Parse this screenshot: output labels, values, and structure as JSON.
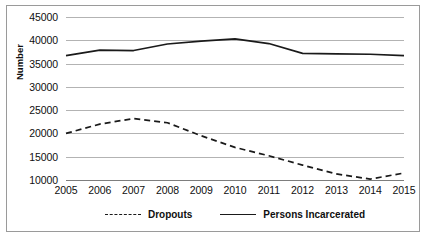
{
  "chart_data": {
    "type": "line",
    "title": "",
    "xlabel": "",
    "ylabel": "Number",
    "categories": [
      "2005",
      "2006",
      "2007",
      "2008",
      "2009",
      "2010",
      "2011",
      "2012",
      "2013",
      "2014",
      "2015"
    ],
    "x": [
      2005,
      2006,
      2007,
      2008,
      2009,
      2010,
      2011,
      2012,
      2013,
      2014,
      2015
    ],
    "ylim": [
      10000,
      45000
    ],
    "yticks": [
      10000,
      15000,
      20000,
      25000,
      30000,
      35000,
      40000,
      45000
    ],
    "ytick_labels": [
      "10000",
      "15000",
      "20000",
      "25000",
      "30000",
      "35000",
      "40000",
      "45000"
    ],
    "grid": "horizontal",
    "legend_position": "bottom",
    "series": [
      {
        "name": "Dropouts",
        "style": "dashed",
        "color": "#1a1a1a",
        "values": [
          20000,
          22000,
          23200,
          22300,
          19500,
          17000,
          15200,
          13200,
          11300,
          10200,
          11500
        ]
      },
      {
        "name": "Persons Incarcerated",
        "style": "solid",
        "color": "#1a1a1a",
        "values": [
          36700,
          37900,
          37800,
          39200,
          39800,
          40300,
          39300,
          37200,
          37100,
          37000,
          36700
        ]
      }
    ]
  },
  "legend": {
    "entries": [
      {
        "label": "Dropouts"
      },
      {
        "label": "Persons Incarcerated"
      }
    ]
  },
  "axes": {
    "y_title": "Number"
  }
}
